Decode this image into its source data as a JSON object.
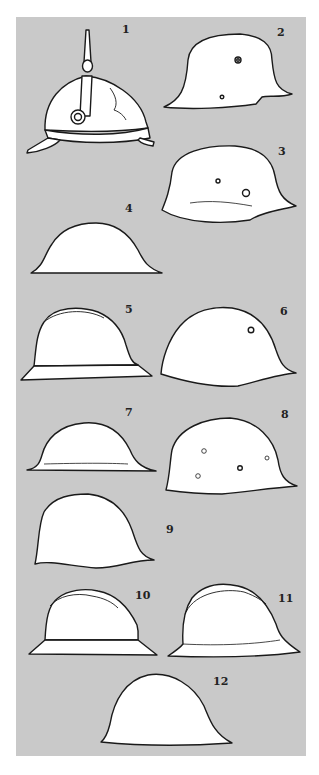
{
  "figure": {
    "background": "#c9c9c9",
    "helmet_fill": "#ffffff",
    "line_color": "#1a1a1a",
    "labels": [
      {
        "id": 1,
        "text": "1",
        "x": 124,
        "y": 24
      },
      {
        "id": 2,
        "text": "2",
        "x": 279,
        "y": 27
      },
      {
        "id": 3,
        "text": "3",
        "x": 280,
        "y": 146
      },
      {
        "id": 4,
        "text": "4",
        "x": 127,
        "y": 203
      },
      {
        "id": 5,
        "text": "5",
        "x": 127,
        "y": 304
      },
      {
        "id": 6,
        "text": "6",
        "x": 282,
        "y": 306
      },
      {
        "id": 7,
        "text": "7",
        "x": 127,
        "y": 408
      },
      {
        "id": 8,
        "text": "8",
        "x": 283,
        "y": 410
      },
      {
        "id": 9,
        "text": "9",
        "x": 168,
        "y": 524
      },
      {
        "id": 10,
        "text": "10",
        "x": 137,
        "y": 591
      },
      {
        "id": 11,
        "text": "11",
        "x": 280,
        "y": 594
      },
      {
        "id": 12,
        "text": "12",
        "x": 215,
        "y": 677
      }
    ]
  }
}
